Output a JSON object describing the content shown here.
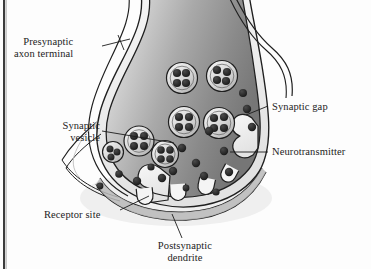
{
  "figure": {
    "width": 371,
    "height": 269,
    "background_color": "#fdfdfd",
    "frame_rule_color": "#3a3a3a"
  },
  "labels": {
    "presynaptic": {
      "line1": "Presynaptic",
      "line2": "axon terminal"
    },
    "vesicle": {
      "line1": "Synaptic",
      "line2": "vesicle"
    },
    "gap": {
      "line1": "Synaptic gap"
    },
    "neurotransmitter": {
      "line1": "Neurotransmitter"
    },
    "receptor": {
      "line1": "Receptor site"
    },
    "postsynaptic": {
      "line1": "Postsynaptic",
      "line2": "dendrite"
    }
  },
  "colors": {
    "membrane_stroke": "#1f1f1f",
    "cytoplasm_light": "#e9e9e9",
    "cytoplasm_mid": "#a8a8a8",
    "cytoplasm_dark": "#6e6e6e",
    "vesicle_fill": "#dcdcdc",
    "neurotransmitter_fill": "#2b2b2b",
    "leader_line": "#1c1c1c",
    "receptor_fill": "#f2f2f2"
  },
  "structures": {
    "axon_terminal": {
      "name": "presynaptic axon terminal",
      "description": "bulb-shaped terminal with double-line membrane and graded gray cytoplasm"
    },
    "synaptic_cleft": {
      "name": "synaptic gap",
      "description": "narrow space between presynaptic membrane and postsynaptic dendrite"
    },
    "postsynaptic_dendrite": {
      "name": "postsynaptic dendrite",
      "description": "membrane band below the gap bearing receptor cups"
    },
    "exocytosis_site": {
      "name": "fusing vesicle",
      "description": "vesicle opened to the membrane releasing neurotransmitter into the gap"
    }
  },
  "counts": {
    "vesicles_intact": 7,
    "receptor_sites": 4,
    "free_neurotransmitters": 17,
    "neurotransmitters_per_vesicle": 4
  },
  "vesicles": [
    {
      "cx": 182,
      "cy": 78,
      "r": 15.5
    },
    {
      "cx": 222,
      "cy": 76,
      "r": 15.5
    },
    {
      "cx": 184,
      "cy": 122,
      "r": 15.5
    },
    {
      "cx": 219,
      "cy": 123,
      "r": 15.5
    },
    {
      "cx": 139,
      "cy": 141,
      "r": 15.0
    },
    {
      "cx": 165,
      "cy": 154,
      "r": 13.5
    },
    {
      "cx": 113,
      "cy": 152,
      "r": 8.0
    }
  ],
  "free_neurotransmitters": [
    {
      "cx": 247,
      "cy": 109,
      "r": 4.2
    },
    {
      "cx": 252,
      "cy": 127,
      "r": 4.2
    },
    {
      "cx": 182,
      "cy": 148,
      "r": 4.2
    },
    {
      "cx": 224,
      "cy": 151,
      "r": 4.2
    },
    {
      "cx": 196,
      "cy": 163,
      "r": 4.2
    },
    {
      "cx": 173,
      "cy": 171,
      "r": 4.2
    },
    {
      "cx": 204,
      "cy": 176,
      "r": 4.2
    },
    {
      "cx": 137,
      "cy": 181,
      "r": 4.2
    },
    {
      "cx": 162,
      "cy": 178,
      "r": 4.2
    },
    {
      "cx": 229,
      "cy": 172,
      "r": 4.2
    },
    {
      "cx": 119,
      "cy": 174,
      "r": 3.8
    },
    {
      "cx": 209,
      "cy": 131,
      "r": 4.2
    },
    {
      "cx": 243,
      "cy": 93,
      "r": 4.0
    },
    {
      "cx": 151,
      "cy": 167,
      "r": 3.6
    },
    {
      "cx": 216,
      "cy": 192,
      "r": 3.6
    },
    {
      "cx": 186,
      "cy": 188,
      "r": 3.4
    },
    {
      "cx": 100,
      "cy": 186,
      "r": 3.4
    }
  ],
  "receptor_sites": [
    {
      "cx": 145,
      "cy": 196,
      "rot": -6
    },
    {
      "cx": 178,
      "cy": 192,
      "rot": -4
    },
    {
      "cx": 206,
      "cy": 186,
      "rot": 10
    },
    {
      "cx": 228,
      "cy": 176,
      "rot": 24
    }
  ],
  "leader_lines": [
    {
      "name": "presynaptic-leader",
      "from": [
        102,
        46
      ],
      "to": [
        128,
        40
      ]
    },
    {
      "name": "vesicle-leader",
      "from": [
        102,
        131
      ],
      "to": [
        172,
        142
      ]
    },
    {
      "name": "gap-leader",
      "from": [
        268,
        106
      ],
      "to": [
        244,
        114
      ]
    },
    {
      "name": "neuro-leader",
      "from": [
        268,
        152
      ],
      "to": [
        232,
        152
      ]
    },
    {
      "name": "receptor-leader",
      "from": [
        120,
        210
      ],
      "to": [
        148,
        197
      ]
    },
    {
      "name": "postsynaptic-leader",
      "from": [
        182,
        237
      ],
      "to": [
        172,
        214
      ]
    }
  ]
}
